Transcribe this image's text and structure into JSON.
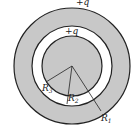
{
  "diagram": {
    "labels": {
      "outer_charge": "+q",
      "inner_charge": "+q",
      "r1": "R",
      "r1_sub": "1",
      "r2": "R",
      "r2_sub": "2",
      "r3": "R",
      "r3_sub": "3"
    },
    "colors": {
      "shell_fill": "#c8c8c8",
      "gap_fill": "#ffffff",
      "stroke": "#222222"
    }
  }
}
